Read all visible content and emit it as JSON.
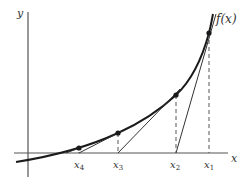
{
  "diagram": {
    "axes": {
      "x_label": "x",
      "y_label": "y"
    },
    "curve_label": "f(x)",
    "points": [
      {
        "name": "x",
        "sub": "1",
        "label": "x1"
      },
      {
        "name": "x",
        "sub": "2",
        "label": "x2"
      },
      {
        "name": "x",
        "sub": "3",
        "label": "x3"
      },
      {
        "name": "x",
        "sub": "4",
        "label": "x4"
      }
    ],
    "colors": {
      "curve": "#1a1a1a",
      "axis": "#555555",
      "tangent": "#333333",
      "dashed": "#555555",
      "text": "#333333"
    }
  }
}
